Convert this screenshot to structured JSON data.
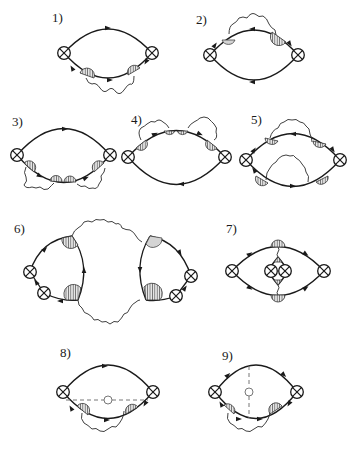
{
  "figure": {
    "panels": [
      {
        "id": 1,
        "label": "1)"
      },
      {
        "id": 2,
        "label": "2)"
      },
      {
        "id": 3,
        "label": "3)"
      },
      {
        "id": 4,
        "label": "4)"
      },
      {
        "id": 5,
        "label": "5)"
      },
      {
        "id": 6,
        "label": "6)"
      },
      {
        "id": 7,
        "label": "7)"
      },
      {
        "id": 8,
        "label": "8)"
      },
      {
        "id": 9,
        "label": "9)"
      }
    ],
    "colors": {
      "line": "#1a1a1a",
      "hatch_fill": "#cfcfcf",
      "dashed": "#777777",
      "background": "#ffffff"
    }
  }
}
